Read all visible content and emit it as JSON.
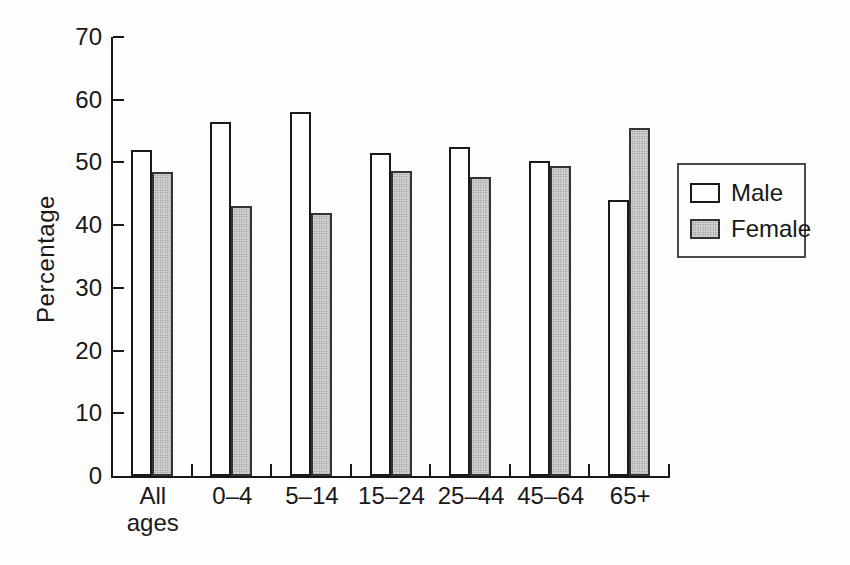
{
  "page": {
    "background": "#fdfdfd",
    "axis_color": "#181818"
  },
  "chart_data": {
    "type": "bar",
    "title": "",
    "xlabel": "",
    "ylabel": "Percentage",
    "ylim": [
      0,
      70
    ],
    "yticks": [
      0,
      10,
      20,
      30,
      40,
      50,
      60,
      70
    ],
    "grid": false,
    "categories": [
      "All\nages",
      "0–4",
      "5–14",
      "15–24",
      "25–44",
      "45–64",
      "65+"
    ],
    "series": [
      {
        "name": "Male",
        "fill": "#ffffff",
        "border": "#1a1a1a",
        "values": [
          52,
          56.5,
          58,
          51.5,
          52.5,
          50.3,
          44
        ]
      },
      {
        "name": "Female",
        "fill": "#d6d6d6",
        "border": "#333333",
        "values": [
          48.5,
          43,
          42,
          48.7,
          47.6,
          49.5,
          55.5
        ]
      }
    ],
    "legend": {
      "position": "right",
      "entries": [
        "Male",
        "Female"
      ]
    }
  }
}
